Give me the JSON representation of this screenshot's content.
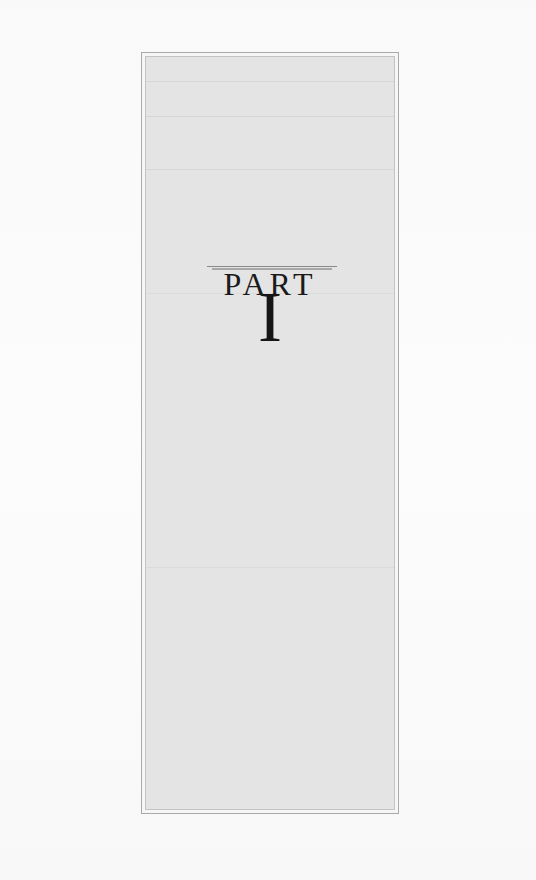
{
  "document": {
    "type": "part-divider-page",
    "heading": "PART",
    "number": "I"
  },
  "colors": {
    "page_background": "#fbfbfb",
    "panel_fill": "#e4e4e4",
    "frame_border": "#a9a9a9",
    "text": "#1b1b1b",
    "rule": "#8a8a8a"
  }
}
